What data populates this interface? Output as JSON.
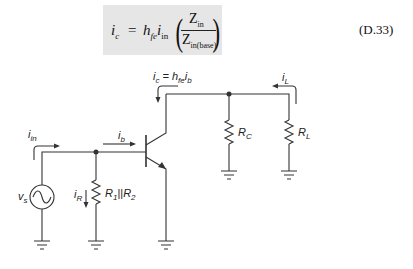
{
  "equation": {
    "lhs": "i",
    "lhs_sub": "c",
    "equals": "=",
    "h": "h",
    "h_sub": "fe",
    "i": "i",
    "i_sub": "in",
    "numerator": "Z",
    "numerator_sub": "in",
    "denominator": "Z",
    "denominator_sub": "in(base)",
    "number": "(D.33)"
  },
  "circuit": {
    "labels": {
      "i_in": {
        "main": "i",
        "sub": "in"
      },
      "i_b": {
        "main": "i",
        "sub": "b"
      },
      "i_c": {
        "main": "i",
        "sub": "c",
        "eq": " = h",
        "eq_sub": "fe",
        "tail": "i",
        "tail_sub": "b"
      },
      "i_L": {
        "main": "i",
        "sub": "L"
      },
      "i_R": {
        "main": "i",
        "sub": "R"
      },
      "v_s": {
        "main": "v",
        "sub": "s"
      },
      "R_bias": {
        "r1": "R",
        "r1_sub": "1",
        "sep": "||",
        "r2": "R",
        "r2_sub": "2"
      },
      "R_C": {
        "main": "R",
        "sub": "C"
      },
      "R_L": {
        "main": "R",
        "sub": "L"
      }
    },
    "colors": {
      "wire": "#333333",
      "background": "#ffffff",
      "equation_box": "#e6e6e6"
    }
  }
}
